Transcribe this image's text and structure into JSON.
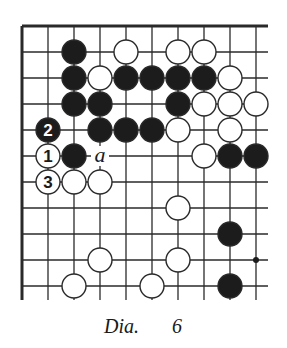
{
  "caption": {
    "label": "Dia.",
    "number": "6"
  },
  "colors": {
    "line": "#2a2a2a",
    "black_stone": "#1c1c1c",
    "white_stone": "#ffffff",
    "background": "#ffffff"
  },
  "board": {
    "origin_x": 22,
    "origin_y": 26,
    "spacing": 26,
    "columns": 10,
    "rows": 11,
    "right_extent": 268,
    "bottom_extent": 300,
    "edges": [
      "top",
      "left"
    ],
    "star_points": [
      {
        "col": 9,
        "row": 9
      }
    ],
    "stones": [
      {
        "col": 2,
        "row": 1,
        "color": "black"
      },
      {
        "col": 4,
        "row": 1,
        "color": "white"
      },
      {
        "col": 6,
        "row": 1,
        "color": "white"
      },
      {
        "col": 7,
        "row": 1,
        "color": "white"
      },
      {
        "col": 2,
        "row": 2,
        "color": "black"
      },
      {
        "col": 3,
        "row": 2,
        "color": "white"
      },
      {
        "col": 4,
        "row": 2,
        "color": "black"
      },
      {
        "col": 5,
        "row": 2,
        "color": "black"
      },
      {
        "col": 6,
        "row": 2,
        "color": "black"
      },
      {
        "col": 7,
        "row": 2,
        "color": "black"
      },
      {
        "col": 8,
        "row": 2,
        "color": "white"
      },
      {
        "col": 2,
        "row": 3,
        "color": "black"
      },
      {
        "col": 3,
        "row": 3,
        "color": "black"
      },
      {
        "col": 6,
        "row": 3,
        "color": "black"
      },
      {
        "col": 7,
        "row": 3,
        "color": "white"
      },
      {
        "col": 8,
        "row": 3,
        "color": "white"
      },
      {
        "col": 9,
        "row": 3,
        "color": "white"
      },
      {
        "col": 1,
        "row": 4,
        "color": "black",
        "label": "2"
      },
      {
        "col": 3,
        "row": 4,
        "color": "black"
      },
      {
        "col": 4,
        "row": 4,
        "color": "black"
      },
      {
        "col": 5,
        "row": 4,
        "color": "black"
      },
      {
        "col": 6,
        "row": 4,
        "color": "white"
      },
      {
        "col": 8,
        "row": 4,
        "color": "white"
      },
      {
        "col": 1,
        "row": 5,
        "color": "white",
        "label": "1"
      },
      {
        "col": 2,
        "row": 5,
        "color": "black"
      },
      {
        "col": 7,
        "row": 5,
        "color": "white"
      },
      {
        "col": 8,
        "row": 5,
        "color": "black"
      },
      {
        "col": 9,
        "row": 5,
        "color": "black"
      },
      {
        "col": 1,
        "row": 6,
        "color": "white",
        "label": "3"
      },
      {
        "col": 2,
        "row": 6,
        "color": "white"
      },
      {
        "col": 3,
        "row": 6,
        "color": "white"
      },
      {
        "col": 6,
        "row": 7,
        "color": "white"
      },
      {
        "col": 8,
        "row": 8,
        "color": "black"
      },
      {
        "col": 3,
        "row": 9,
        "color": "white"
      },
      {
        "col": 6,
        "row": 9,
        "color": "white"
      },
      {
        "col": 2,
        "row": 10,
        "color": "white"
      },
      {
        "col": 5,
        "row": 10,
        "color": "white"
      },
      {
        "col": 8,
        "row": 10,
        "color": "black"
      }
    ],
    "markers": [
      {
        "col": 3,
        "row": 5,
        "text": "a"
      }
    ]
  }
}
